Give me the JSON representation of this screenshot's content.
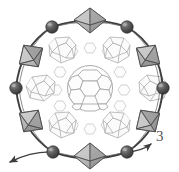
{
  "figure": {
    "label": "3",
    "caption_number": "3",
    "width": 179,
    "height": 172
  },
  "colors": {
    "background": "#ffffff",
    "sphere_dark": "#4a4a4a",
    "sphere_highlight": "#8f8f8f",
    "sphere_outline": "#2b2b2b",
    "bond_stroke": "#3d3d3d",
    "octahedron_fill": "#b8b8b8",
    "octahedron_fill_light": "#d2d2d2",
    "octahedron_fill_dark": "#8d8d8d",
    "octahedron_stroke": "#4f4f4f",
    "cage_stroke": "#b0b0b0",
    "cage_fill": "#fbfbfb",
    "fullerene_stroke": "#a8a8a8",
    "fullerene_fill": "#fdfdfd",
    "small_cage_stroke": "#c4c4c4",
    "arrow_stroke": "#3d3d3d",
    "label_color": "#555555"
  },
  "ring": {
    "type": "hexagonal-macrocycle",
    "vertex_count": 6,
    "vertices": [
      {
        "id": "node-top-left",
        "cx": 52,
        "cy": 27,
        "r": 6.2
      },
      {
        "id": "node-top-right",
        "cx": 127,
        "cy": 27,
        "r": 6.2
      },
      {
        "id": "node-right",
        "cx": 163,
        "cy": 88,
        "r": 6.2
      },
      {
        "id": "node-bottom-right",
        "cx": 127,
        "cy": 152,
        "r": 6.2
      },
      {
        "id": "node-bottom-left",
        "cx": 53,
        "cy": 152,
        "r": 6.2
      },
      {
        "id": "node-left",
        "cx": 16,
        "cy": 88,
        "r": 6.2
      }
    ],
    "octahedra": [
      {
        "id": "octahedron-top",
        "cx": 90,
        "cy": 21,
        "rx": 16,
        "ry": 12,
        "rot": 0
      },
      {
        "id": "octahedron-upper-right",
        "cx": 148,
        "cy": 56,
        "rx": 14,
        "ry": 11,
        "rot": 35
      },
      {
        "id": "octahedron-lower-right",
        "cx": 148,
        "cy": 121,
        "rx": 14,
        "ry": 11,
        "rot": -35
      },
      {
        "id": "octahedron-bottom",
        "cx": 90,
        "cy": 156,
        "rx": 16,
        "ry": 12,
        "rot": 0
      },
      {
        "id": "octahedron-lower-left",
        "cx": 31,
        "cy": 121,
        "rx": 14,
        "ry": 11,
        "rot": 35
      },
      {
        "id": "octahedron-upper-left",
        "cx": 31,
        "cy": 56,
        "rx": 14,
        "ry": 11,
        "rot": -35
      }
    ]
  },
  "cages": {
    "count": 6,
    "items": [
      {
        "id": "cage-upper-left",
        "cx": 62,
        "cy": 50,
        "r": 15
      },
      {
        "id": "cage-upper-right",
        "cx": 117,
        "cy": 50,
        "r": 15
      },
      {
        "id": "cage-mid-left",
        "cx": 41,
        "cy": 88,
        "r": 15
      },
      {
        "id": "cage-mid-right",
        "cx": 139,
        "cy": 88,
        "r": 15
      },
      {
        "id": "cage-lower-left",
        "cx": 62,
        "cy": 127,
        "r": 15
      },
      {
        "id": "cage-lower-right",
        "cx": 117,
        "cy": 127,
        "r": 15
      }
    ]
  },
  "fullerene": {
    "id": "central-fullerene",
    "cx": 90,
    "cy": 88,
    "r": 23,
    "type": "truncated-icosahedron"
  },
  "small_cages": {
    "count": 12,
    "items": [
      {
        "cx": 72,
        "cy": 52,
        "r": 6
      },
      {
        "cx": 90,
        "cy": 48,
        "r": 6
      },
      {
        "cx": 108,
        "cy": 52,
        "r": 6
      },
      {
        "cx": 60,
        "cy": 72,
        "r": 6
      },
      {
        "cx": 120,
        "cy": 72,
        "r": 6
      },
      {
        "cx": 56,
        "cy": 90,
        "r": 6
      },
      {
        "cx": 124,
        "cy": 90,
        "r": 6
      },
      {
        "cx": 60,
        "cy": 106,
        "r": 6
      },
      {
        "cx": 120,
        "cy": 106,
        "r": 6
      },
      {
        "cx": 72,
        "cy": 125,
        "r": 6
      },
      {
        "cx": 90,
        "cy": 129,
        "r": 6
      },
      {
        "cx": 108,
        "cy": 125,
        "r": 6
      }
    ]
  },
  "arrows": [
    {
      "id": "arrow-left",
      "from_x": 53,
      "from_y": 152,
      "to_x": 8,
      "to_y": 163
    },
    {
      "id": "arrow-right",
      "from_x": 127,
      "from_y": 152,
      "to_x": 152,
      "to_y": 143
    }
  ]
}
